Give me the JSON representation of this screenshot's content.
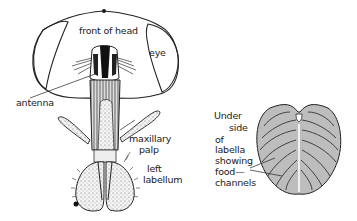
{
  "figure": {
    "left_panel": {
      "name": "fly head front view",
      "labels": {
        "front_of_head": "front of head",
        "eye": "eye",
        "antenna": "antenna",
        "maxillary_palp_1": "maxillary",
        "maxillary_palp_2": "palp",
        "left_labellum_1": "left",
        "left_labellum_2": "labellum"
      }
    },
    "right_panel": {
      "name": "underside of labella",
      "labels": {
        "line1": "Under",
        "line2": "side",
        "line3": "of",
        "line4": "labella",
        "line5": "showing",
        "line6": "food—",
        "line7": "channels"
      }
    }
  }
}
